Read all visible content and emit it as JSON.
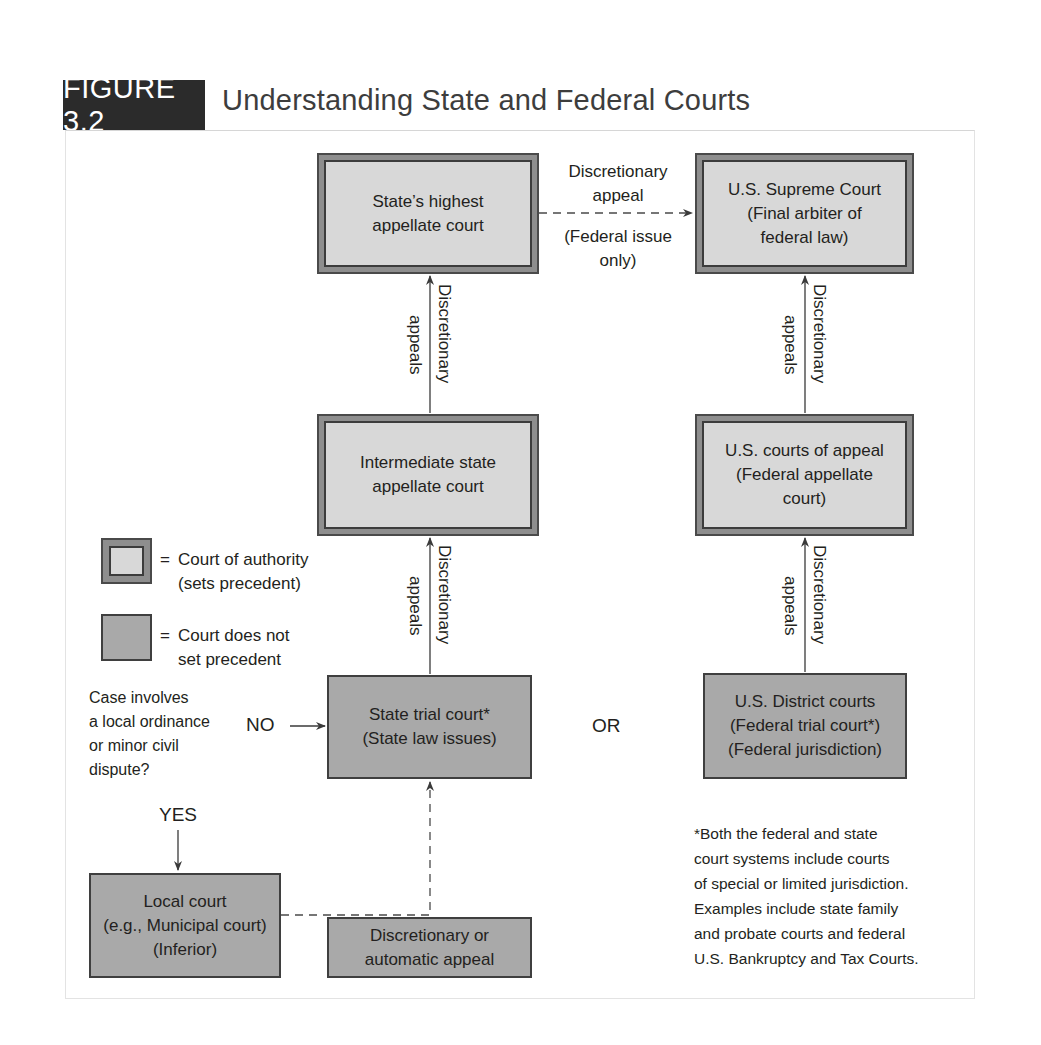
{
  "figure": {
    "badge": "FIGURE 3.2",
    "title": "Understanding State and Federal Courts",
    "colors": {
      "badge_bg": "#2b2b2b",
      "authority_fill": "#d8d8d8",
      "authority_band": "#8e8e8e",
      "plain_fill": "#a9a9a9",
      "border_dark": "#3f3f3f",
      "text": "#231f20"
    }
  },
  "nodes": {
    "state_highest": {
      "line1": "State’s highest",
      "line2": "appellate court",
      "type": "authority"
    },
    "us_supreme": {
      "line1": "U.S. Supreme Court",
      "line2": "(Final arbiter of",
      "line3": "federal law)",
      "type": "authority"
    },
    "intermediate_state": {
      "line1": "Intermediate state",
      "line2": "appellate court",
      "type": "authority"
    },
    "us_appeals": {
      "line1": "U.S. courts of appeal",
      "line2": "(Federal appellate",
      "line3": "court)",
      "type": "authority"
    },
    "state_trial": {
      "line1": "State trial court*",
      "line2": "(State law issues)",
      "type": "plain"
    },
    "us_district": {
      "line1": "U.S. District courts",
      "line2": "(Federal trial court*)",
      "line3": "(Federal jurisdiction)",
      "type": "plain"
    },
    "local_court": {
      "line1": "Local court",
      "line2": "(e.g., Municipal court)",
      "line3": "(Inferior)",
      "type": "plain"
    },
    "disc_or_auto": {
      "line1": "Discretionary or",
      "line2": "automatic appeal",
      "type": "plain"
    }
  },
  "edges": {
    "state_to_supreme": {
      "above1": "Discretionary",
      "above2": "appeal",
      "below1": "(Federal issue",
      "below2": "only)",
      "style": "dashed"
    },
    "intermediate_to_highest": {
      "right": "Discretionary",
      "left": "appeals"
    },
    "trial_to_intermediate": {
      "right": "Discretionary",
      "left": "appeals"
    },
    "appeals_to_supreme": {
      "right": "Discretionary",
      "left": "appeals"
    },
    "district_to_appeals": {
      "right": "Discretionary",
      "left": "appeals"
    },
    "question_no": "NO",
    "question_yes": "YES",
    "or_label": "OR"
  },
  "question": {
    "lines": [
      "Case involves",
      "a local ordinance",
      "or minor civil",
      "dispute?"
    ]
  },
  "legend": {
    "authority": {
      "eq": "=",
      "line1": "Court of authority",
      "line2": "(sets precedent)"
    },
    "plain": {
      "eq": "=",
      "line1": "Court does not",
      "line2": "set precedent"
    }
  },
  "footnote": {
    "lines": [
      "*Both the federal and state",
      "court systems include courts",
      "of special or limited jurisdiction.",
      "Examples include state family",
      "and probate courts and federal",
      "U.S. Bankruptcy and Tax Courts."
    ]
  }
}
